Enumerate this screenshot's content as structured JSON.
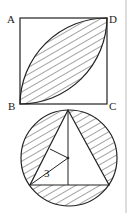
{
  "figure_top": {
    "description": "Square ABCD with two quarter-circle arcs forming a hatched leaf shape",
    "labels": {
      "A": "A",
      "B": "B",
      "C": "C",
      "D": "D"
    }
  },
  "figure_bottom": {
    "description": "Equilateral triangle inscribed in a circle, region between circle and triangle hatched",
    "radius_label": "3"
  },
  "colors": {
    "stroke": "#222222",
    "hatch": "#333333",
    "background": "#ffffff"
  }
}
